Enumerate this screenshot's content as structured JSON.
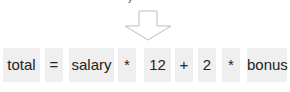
{
  "diagram": {
    "top_fragment": "y",
    "arrow": "down-arrow-outline",
    "tokens": [
      {
        "text": "total",
        "left": 3,
        "width": 37
      },
      {
        "text": "=",
        "left": 45,
        "width": 18
      },
      {
        "text": "salary",
        "left": 69,
        "width": 45
      },
      {
        "text": "*",
        "left": 118,
        "width": 18
      },
      {
        "text": "12",
        "left": 144,
        "width": 27
      },
      {
        "text": "+",
        "left": 175,
        "width": 18
      },
      {
        "text": "2",
        "left": 198,
        "width": 18
      },
      {
        "text": "*",
        "left": 222,
        "width": 18
      },
      {
        "text": "bonus",
        "left": 247,
        "width": 40
      }
    ],
    "colors": {
      "token_bg": "#efefef",
      "arrow_stroke": "#bbbbbb",
      "text": "#222222"
    }
  }
}
